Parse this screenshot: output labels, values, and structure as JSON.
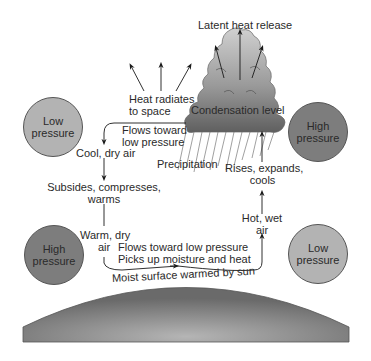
{
  "diagram": {
    "labels": {
      "latent_heat": "Latent heat release",
      "heat_radiates_1": "Heat radiates",
      "heat_radiates_2": "to space",
      "condensation": "Condensation level",
      "flows_toward_top_1": "Flows toward",
      "flows_toward_top_2": "low pressure",
      "cool_dry": "Cool, dry air",
      "precipitation": "Precipitation",
      "rises_1": "Rises, expands,",
      "rises_2": "cools",
      "subsides_1": "Subsides, compresses,",
      "subsides_2": "warms",
      "hot_wet_1": "Hot, wet",
      "hot_wet_2": "air",
      "warm_dry_1": "Warm, dry",
      "warm_dry_2": "air",
      "flows_bottom_1": "Flows toward low pressure",
      "flows_bottom_2": "Picks up moisture and heat",
      "moist_surface": "Moist surface warmed by sun"
    },
    "pressure_zones": [
      {
        "id": "top-left",
        "line1": "Low",
        "line2": "pressure",
        "type": "low"
      },
      {
        "id": "top-right",
        "line1": "High",
        "line2": "pressure",
        "type": "high"
      },
      {
        "id": "bottom-left",
        "line1": "High",
        "line2": "pressure",
        "type": "high"
      },
      {
        "id": "bottom-right",
        "line1": "Low",
        "line2": "pressure",
        "type": "low"
      }
    ],
    "colors": {
      "low_pressure_fill": "#b3b3b3",
      "high_pressure_fill": "#7d7d7d",
      "cloud_top": "#c8c8c8",
      "cloud_bottom": "#6e6e6e",
      "ground": "#8a8a8a",
      "arrow": "#1a1a1a"
    }
  }
}
